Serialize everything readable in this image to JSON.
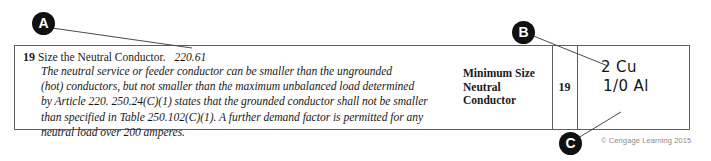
{
  "callouts": [
    {
      "id": "A",
      "label": "A"
    },
    {
      "id": "B",
      "label": "B"
    },
    {
      "id": "C",
      "label": "C"
    }
  ],
  "question": {
    "number": "19",
    "title": "Size the Neutral Conductor.",
    "code_reference": "220.61",
    "body_lines": [
      "The neutral service or feeder conductor can be smaller than the ungrounded",
      "(hot) conductors, but not smaller than the maximum unbalanced load determined",
      "by Article 220. 250.24(C)(1) states that the grounded conductor shall not be smaller",
      "than specified in Table 250.102(C)(1). A further demand factor is permitted for any",
      "neutral load over 200 amperes."
    ]
  },
  "answer_row": {
    "label_lines": [
      "Minimum Size",
      "Neutral",
      "Conductor"
    ],
    "item_number": "19",
    "handwritten_lines": [
      "2 Cu",
      "1/0 Al"
    ]
  },
  "copyright": "© Cengage Learning 2015",
  "colors": {
    "border": "#5d5d5d",
    "callout_fill": "#111111",
    "callout_text": "#ffffff",
    "copyright_text": "#8a8a8a",
    "ink": "#151515"
  }
}
